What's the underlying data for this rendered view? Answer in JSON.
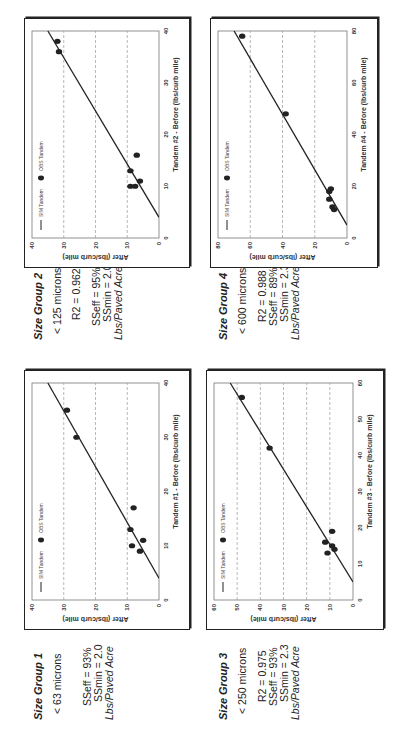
{
  "groups": [
    {
      "title": "Size Group 1",
      "size": "< 63 microns",
      "r2": "",
      "sseff": "SSeff = 93%",
      "ssmin": "SSmin = 2.0",
      "units": "Lbs/Paved Acre"
    },
    {
      "title": "Size Group 2",
      "size": "< 125 microns",
      "r2": "R2 = 0.962",
      "sseff": "SSeff = 95%",
      "ssmin": "SSmin = 2.0",
      "units": "Lbs/Paved Acre"
    },
    {
      "title": "Size Group 3",
      "size": "< 250 microns",
      "r2": "R2 = 0.975",
      "sseff": "SSeff = 93%",
      "ssmin": "SSmin = 2.3",
      "units": "Lbs/Paved Acre"
    },
    {
      "title": "Size Group 4",
      "size": "< 600 microns",
      "r2": "R2 = 0.988",
      "sseff": "SSeff = 89%",
      "ssmin": "SSmin = 2.3",
      "units": "Lbs/Paved Acre"
    }
  ],
  "colors": {
    "ink": "#222222",
    "grid": "#999999"
  },
  "chart_data": [
    {
      "type": "scatter",
      "title": "Size Group 1",
      "xlabel": "Tandem #1 - Before (lbs/curb mile)",
      "ylabel": "After (lbs/curb mile)",
      "xlim": [
        0,
        40
      ],
      "ylim": [
        0,
        40
      ],
      "xticks": [
        0,
        10,
        20,
        30,
        40
      ],
      "yticks": [
        0,
        10,
        20,
        30,
        40
      ],
      "grid": "horizontal dashed",
      "legend": [
        "SIM Tandem",
        "OBS Tandem"
      ],
      "legend_position": "top-left",
      "series": [
        {
          "name": "SIM Tandem",
          "kind": "line",
          "x": [
            4,
            40
          ],
          "y": [
            0,
            35
          ]
        },
        {
          "name": "OBS Tandem",
          "kind": "points",
          "x": [
            9,
            10,
            11,
            13,
            17,
            30,
            35
          ],
          "y": [
            6,
            8.5,
            5,
            9,
            8,
            26,
            29
          ]
        }
      ]
    },
    {
      "type": "scatter",
      "title": "Size Group 2",
      "xlabel": "Tandem #2 - Before (lbs/curb mile)",
      "ylabel": "After (lbs/curb mile)",
      "xlim": [
        0,
        40
      ],
      "ylim": [
        0,
        40
      ],
      "xticks": [
        0,
        10,
        20,
        30,
        40
      ],
      "yticks": [
        0,
        10,
        20,
        30,
        40
      ],
      "grid": "horizontal dashed",
      "legend": [
        "SIM Tandem",
        "OBS Tandem"
      ],
      "legend_position": "top-left",
      "series": [
        {
          "name": "SIM Tandem",
          "kind": "line",
          "x": [
            4,
            40
          ],
          "y": [
            0,
            35
          ]
        },
        {
          "name": "OBS Tandem",
          "kind": "points",
          "x": [
            10,
            10,
            11,
            13,
            16,
            36,
            38
          ],
          "y": [
            9,
            7.5,
            6,
            9,
            7,
            31.5,
            32
          ]
        }
      ]
    },
    {
      "type": "scatter",
      "title": "Size Group 3",
      "xlabel": "Tandem #3 - Before (lbs/curb mile)",
      "ylabel": "After (lbs/curb mile)",
      "xlim": [
        0,
        60
      ],
      "ylim": [
        0,
        60
      ],
      "xticks": [
        0,
        10,
        20,
        30,
        40,
        50,
        60
      ],
      "yticks": [
        0,
        10,
        20,
        30,
        40,
        50,
        60
      ],
      "grid": "horizontal dashed",
      "legend": [
        "SIM Tandem",
        "OBS Tandem"
      ],
      "legend_position": "top-left",
      "series": [
        {
          "name": "SIM Tandem",
          "kind": "line",
          "x": [
            5,
            60
          ],
          "y": [
            0,
            53
          ]
        },
        {
          "name": "OBS Tandem",
          "kind": "points",
          "x": [
            13,
            14,
            15,
            16,
            19,
            42,
            56
          ],
          "y": [
            11,
            8,
            9,
            12,
            9,
            36,
            48
          ]
        }
      ]
    },
    {
      "type": "scatter",
      "title": "Size Group 4",
      "xlabel": "Tandem #4 - Before (lbs/curb mile)",
      "ylabel": "After (lbs/curb mile)",
      "xlim": [
        0,
        80
      ],
      "ylim": [
        0,
        80
      ],
      "xticks": [
        0,
        20,
        40,
        60,
        80
      ],
      "yticks": [
        0,
        20,
        40,
        60,
        80
      ],
      "grid": "horizontal dashed",
      "legend": [
        "SIM Tandem",
        "OBS Tandem"
      ],
      "legend_position": "top-left",
      "series": [
        {
          "name": "SIM Tandem",
          "kind": "line",
          "x": [
            5,
            80
          ],
          "y": [
            0,
            70
          ]
        },
        {
          "name": "OBS Tandem",
          "kind": "points",
          "x": [
            11,
            12,
            15,
            18,
            19,
            48,
            78
          ],
          "y": [
            8,
            9,
            11,
            11,
            10,
            38,
            65
          ]
        }
      ]
    }
  ]
}
